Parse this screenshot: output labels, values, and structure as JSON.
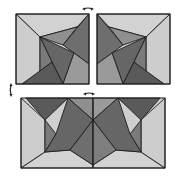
{
  "diagram": {
    "colors": {
      "light": "#cfcfcf",
      "mid": "#9a9a9a",
      "dark": "#6e6e6e",
      "darker": "#555555",
      "outline": "#1e1e1e"
    },
    "panels": [
      {
        "id": "square-left",
        "label": ""
      },
      {
        "id": "square-right",
        "label": ""
      },
      {
        "id": "rectangle-combined",
        "label": ""
      }
    ],
    "arrows": [
      {
        "id": "arrow-top-center",
        "type": "double-horizontal"
      },
      {
        "id": "arrow-left-middle",
        "type": "double-vertical"
      },
      {
        "id": "arrow-bottom-center",
        "type": "double-horizontal"
      }
    ]
  }
}
